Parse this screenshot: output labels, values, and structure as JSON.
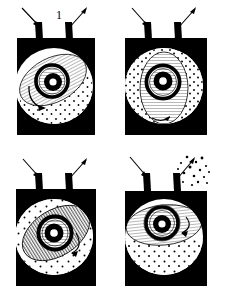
{
  "figure": {
    "background_color": "#ffffff",
    "ink_color": "#000000",
    "panel_count": 4,
    "layout": "2x2 grid"
  },
  "panels": [
    {
      "number": "1",
      "name": "intake-stage",
      "caption": "Stage 1",
      "box_color": "#000000",
      "body_color": "#ffffff",
      "left_tube": {
        "label": "intake-tube",
        "arrow": "inward",
        "arrow_direction": "down-right"
      },
      "right_tube": {
        "label": "exhaust-tube",
        "arrow": "outward",
        "arrow_direction": "up-right"
      },
      "inner_region": {
        "shape": "tilted-ellipse",
        "tilt_degrees": -28,
        "fill": "fine-hatch"
      },
      "stipple_region": "lower-right",
      "swirl_arrow": "lower-left-counterclockwise",
      "core": {
        "rings": 3,
        "center": "white-dot"
      },
      "ejecta": false
    },
    {
      "number": "2",
      "name": "compression-stage",
      "caption": "Stage 2",
      "box_color": "#000000",
      "body_color": "#ffffff",
      "left_tube": {
        "label": "intake-tube",
        "arrow": "inward",
        "arrow_direction": "down-right"
      },
      "right_tube": {
        "label": "exhaust-tube",
        "arrow": "outward",
        "arrow_direction": "up-right"
      },
      "inner_region": {
        "shape": "upright-ellipse",
        "tilt_degrees": 0,
        "fill": "fine-hatch"
      },
      "stipple_region": "outer-ring-both-sides",
      "swirl_arrow": "bottom-small-hook",
      "core": {
        "rings": 3,
        "center": "white-dot"
      },
      "ejecta": false
    },
    {
      "number": "3",
      "name": "ignition-stage",
      "caption": "Stage 3",
      "box_color": "#000000",
      "body_color": "#ffffff",
      "left_tube": {
        "label": "intake-tube",
        "arrow": "inward",
        "arrow_direction": "down-right"
      },
      "right_tube": {
        "label": "exhaust-tube",
        "arrow": "outward",
        "arrow_direction": "up-right"
      },
      "inner_region": {
        "shape": "tilted-ellipse",
        "tilt_degrees": -32,
        "fill": "vertical-stripe"
      },
      "stipple_region": "upper-right-dense",
      "swirl_arrow": "right-clockwise",
      "core": {
        "rings": 3,
        "center": "white-dot"
      },
      "ejecta": false
    },
    {
      "number": "4",
      "name": "ejection-stage",
      "caption": "Stage 4",
      "box_color": "#000000",
      "body_color": "#ffffff",
      "left_tube": {
        "label": "intake-tube",
        "arrow": "inward",
        "arrow_direction": "down-right"
      },
      "right_tube": {
        "label": "exhaust-tube",
        "arrow": "outward-with-particles",
        "arrow_direction": "up-right"
      },
      "inner_region": {
        "shape": "flat-ellipse",
        "tilt_degrees": -6,
        "fill": "fine-hatch"
      },
      "stipple_region": "lower-half",
      "swirl_arrow": "right-small-hook",
      "core": {
        "rings": 3,
        "center": "white-dot"
      },
      "ejecta": true
    }
  ]
}
